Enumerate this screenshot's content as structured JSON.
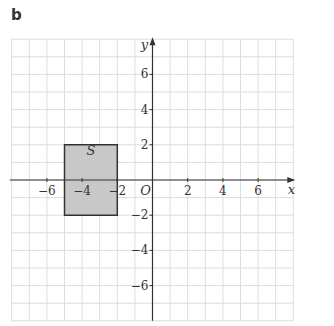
{
  "figure": {
    "part_label": "b"
  },
  "chart_data": {
    "type": "diagram",
    "title": "",
    "xlabel": "x",
    "ylabel": "y",
    "origin_label": "O",
    "xlim": [
      -8,
      8
    ],
    "ylim": [
      -8,
      8
    ],
    "grid": true,
    "grid_step": 1,
    "x_ticks": [
      -6,
      -4,
      -2,
      2,
      4,
      6
    ],
    "y_ticks": [
      6,
      4,
      2,
      -2,
      -4,
      -6
    ],
    "x_tick_labels": [
      "−6",
      "−4",
      "−2",
      "2",
      "4",
      "6"
    ],
    "y_tick_labels": [
      "6",
      "4",
      "2",
      "−2",
      "−4",
      "−6"
    ],
    "shapes": [
      {
        "label": "S",
        "type": "rectangle",
        "vertices": [
          [
            -5,
            2
          ],
          [
            -2,
            2
          ],
          [
            -2,
            -2
          ],
          [
            -5,
            -2
          ]
        ],
        "fill": "#c8c8c8",
        "stroke": "#333333"
      }
    ]
  }
}
